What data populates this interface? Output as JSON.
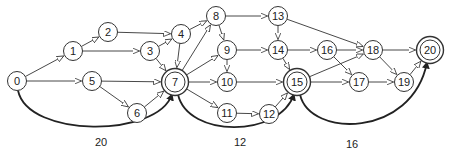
{
  "diagram": {
    "colors": {
      "stroke": "#333333",
      "fill": "#ffffff",
      "text": "#222222"
    },
    "nodes": [
      {
        "id": "0",
        "x": 17,
        "y": 81,
        "double": false
      },
      {
        "id": "1",
        "x": 73,
        "y": 51,
        "double": false
      },
      {
        "id": "2",
        "x": 108,
        "y": 32,
        "double": false
      },
      {
        "id": "3",
        "x": 150,
        "y": 51,
        "double": false
      },
      {
        "id": "4",
        "x": 181,
        "y": 34,
        "double": false
      },
      {
        "id": "5",
        "x": 92,
        "y": 81,
        "double": false
      },
      {
        "id": "6",
        "x": 137,
        "y": 113,
        "double": false
      },
      {
        "id": "7",
        "x": 175,
        "y": 82,
        "double": true
      },
      {
        "id": "8",
        "x": 216,
        "y": 16,
        "double": false
      },
      {
        "id": "9",
        "x": 227,
        "y": 50,
        "double": false
      },
      {
        "id": "10",
        "x": 227,
        "y": 82,
        "double": false
      },
      {
        "id": "11",
        "x": 227,
        "y": 113,
        "double": false
      },
      {
        "id": "12",
        "x": 269,
        "y": 114,
        "double": false
      },
      {
        "id": "13",
        "x": 278,
        "y": 16,
        "double": false
      },
      {
        "id": "14",
        "x": 278,
        "y": 50,
        "double": false
      },
      {
        "id": "15",
        "x": 297,
        "y": 82,
        "double": true
      },
      {
        "id": "16",
        "x": 327,
        "y": 50,
        "double": false
      },
      {
        "id": "17",
        "x": 359,
        "y": 82,
        "double": false
      },
      {
        "id": "18",
        "x": 373,
        "y": 50,
        "double": false
      },
      {
        "id": "19",
        "x": 404,
        "y": 82,
        "double": false
      },
      {
        "id": "20",
        "x": 430,
        "y": 50,
        "double": true
      }
    ],
    "edges": [
      {
        "from": "0",
        "to": "1"
      },
      {
        "from": "0",
        "to": "5"
      },
      {
        "from": "1",
        "to": "2"
      },
      {
        "from": "1",
        "to": "3"
      },
      {
        "from": "2",
        "to": "4"
      },
      {
        "from": "3",
        "to": "4"
      },
      {
        "from": "3",
        "to": "7"
      },
      {
        "from": "4",
        "to": "7"
      },
      {
        "from": "4",
        "to": "8"
      },
      {
        "from": "5",
        "to": "7"
      },
      {
        "from": "5",
        "to": "6"
      },
      {
        "from": "6",
        "to": "7"
      },
      {
        "from": "7",
        "to": "8"
      },
      {
        "from": "7",
        "to": "9"
      },
      {
        "from": "7",
        "to": "10"
      },
      {
        "from": "7",
        "to": "11"
      },
      {
        "from": "8",
        "to": "9"
      },
      {
        "from": "8",
        "to": "13"
      },
      {
        "from": "9",
        "to": "10"
      },
      {
        "from": "9",
        "to": "14"
      },
      {
        "from": "10",
        "to": "15"
      },
      {
        "from": "11",
        "to": "12"
      },
      {
        "from": "12",
        "to": "15"
      },
      {
        "from": "13",
        "to": "14"
      },
      {
        "from": "13",
        "to": "18"
      },
      {
        "from": "14",
        "to": "15"
      },
      {
        "from": "14",
        "to": "16"
      },
      {
        "from": "15",
        "to": "17"
      },
      {
        "from": "15",
        "to": "18"
      },
      {
        "from": "16",
        "to": "18"
      },
      {
        "from": "16",
        "to": "17"
      },
      {
        "from": "17",
        "to": "19"
      },
      {
        "from": "18",
        "to": "19"
      },
      {
        "from": "18",
        "to": "20"
      },
      {
        "from": "19",
        "to": "20"
      }
    ],
    "arcs": [
      {
        "from": "0",
        "to": "7",
        "label": "20",
        "label_x": 101,
        "label_y": 142
      },
      {
        "from": "7",
        "to": "15",
        "label": "12",
        "label_x": 240,
        "label_y": 142
      },
      {
        "from": "15",
        "to": "20",
        "label": "16",
        "label_x": 352,
        "label_y": 144
      }
    ]
  }
}
